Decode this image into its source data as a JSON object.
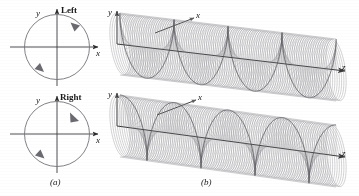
{
  "figure": {
    "caption_a": "(a)",
    "caption_b": "(b)",
    "panel_a": {
      "name": "circular-polarization-phasor-circles",
      "diagrams": [
        {
          "handedness_label": "Left",
          "rotation": "counterclockwise",
          "x_axis_label": "x",
          "y_axis_label": "y",
          "center": [
            57,
            47
          ],
          "radius": 33
        },
        {
          "handedness_label": "Right",
          "rotation": "clockwise",
          "x_axis_label": "x",
          "y_axis_label": "y",
          "center": [
            57,
            134
          ],
          "radius": 33
        }
      ]
    },
    "panel_b": {
      "name": "helical-wave-cylinders",
      "diagrams": [
        {
          "handedness": "left",
          "x_axis_label": "x",
          "y_axis_label": "y",
          "z_axis_label": "z",
          "turns": 4,
          "radial_spokes": 120
        },
        {
          "handedness": "right",
          "x_axis_label": "x",
          "y_axis_label": "y",
          "z_axis_label": "z",
          "turns": 4,
          "radial_spokes": 120
        }
      ]
    }
  },
  "colors": {
    "ink": "#2b2b2b",
    "line": "#6e6e72",
    "faint": "#9a9aa0",
    "background": "#ffffff"
  }
}
